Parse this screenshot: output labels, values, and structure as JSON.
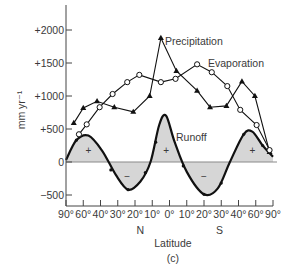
{
  "chart_data": {
    "type": "line",
    "title": "",
    "panel_label": "(c)",
    "xlabel": "Latitude",
    "ylabel": "mm yr⁻¹",
    "ylim": [
      -650,
      2400
    ],
    "y_ticks": [
      {
        "value": 2000,
        "label": "+2000"
      },
      {
        "value": 1500,
        "label": "+1500"
      },
      {
        "value": 1000,
        "label": "+1000"
      },
      {
        "value": 500,
        "label": "+500"
      },
      {
        "value": 0,
        "label": "0"
      },
      {
        "value": -500,
        "label": "−500"
      }
    ],
    "x_ticks": [
      {
        "lat": 90,
        "hemi": "N",
        "label": "90°"
      },
      {
        "lat": 60,
        "hemi": "N",
        "label": "60°"
      },
      {
        "lat": 40,
        "hemi": "N",
        "label": "40°"
      },
      {
        "lat": 30,
        "hemi": "N",
        "label": "30°"
      },
      {
        "lat": 20,
        "hemi": "N",
        "label": "20°"
      },
      {
        "lat": 10,
        "hemi": "N",
        "label": "10°"
      },
      {
        "lat": 0,
        "hemi": "",
        "label": "0°"
      },
      {
        "lat": 10,
        "hemi": "S",
        "label": "10°"
      },
      {
        "lat": 20,
        "hemi": "S",
        "label": "20°"
      },
      {
        "lat": 30,
        "hemi": "S",
        "label": "30°"
      },
      {
        "lat": 40,
        "hemi": "S",
        "label": "40°"
      },
      {
        "lat": 60,
        "hemi": "S",
        "label": "60°"
      },
      {
        "lat": 90,
        "hemi": "S",
        "label": "90°"
      }
    ],
    "hemisphere_labels": {
      "north": "N",
      "south": "S"
    },
    "grid": false,
    "legend_position": "inline labels",
    "series": [
      {
        "name": "Precipitation",
        "marker": "filled-triangle",
        "x_tick_pos": [
          0.45,
          1.0,
          1.8,
          2.8,
          3.9,
          4.85,
          5.5,
          6.4,
          7.6,
          8.35,
          9.3,
          10.2,
          10.95,
          11.8
        ],
        "values": [
          590,
          820,
          920,
          830,
          760,
          1000,
          1880,
          1380,
          1080,
          830,
          850,
          1220,
          1000,
          150
        ]
      },
      {
        "name": "Evaporation",
        "marker": "open-circle",
        "x_tick_pos": [
          0.75,
          1.2,
          1.95,
          2.7,
          3.55,
          4.25,
          5.5,
          6.35,
          7.6,
          8.45,
          9.35,
          10.1,
          11.05,
          11.8
        ],
        "values": [
          420,
          570,
          830,
          1030,
          1210,
          1320,
          1210,
          1260,
          1480,
          1360,
          1150,
          790,
          560,
          180
        ]
      },
      {
        "name": "Runoff",
        "style": "smooth curve, shaded to zero",
        "fill": "#d6d6d6",
        "annotations": [
          "+",
          "−",
          "+",
          "−",
          "+"
        ],
        "x_tick_pos": [
          0,
          0.6,
          1.3,
          2.1,
          2.9,
          3.6,
          4.3,
          4.9,
          5.4,
          5.8,
          6.3,
          7.0,
          8.0,
          8.8,
          9.5,
          10.3,
          10.8,
          11.4,
          12
        ],
        "values": [
          30,
          330,
          400,
          170,
          -200,
          -420,
          -300,
          0,
          560,
          700,
          300,
          -150,
          -490,
          -400,
          0,
          420,
          460,
          250,
          80
        ]
      }
    ]
  },
  "labels": {
    "precipitation": "Precipitation",
    "evaporation": "Evaporation",
    "runoff": "Runoff",
    "plus": "+",
    "minus": "−"
  }
}
